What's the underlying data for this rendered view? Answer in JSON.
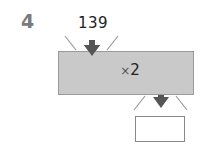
{
  "question": {
    "number": "4"
  },
  "machine": {
    "input_value": "139",
    "operation_symbol": "×",
    "operation_value": "2",
    "fill_color": "#c9c9c9",
    "arrow_color": "#555555"
  },
  "answer": {
    "value": ""
  }
}
